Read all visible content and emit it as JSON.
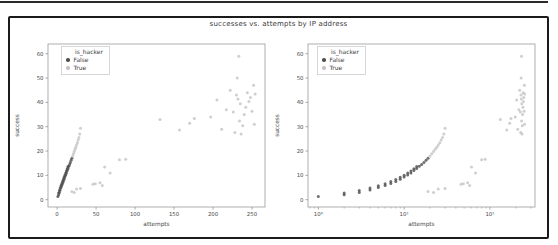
{
  "figure": {
    "title": "successes vs. attempts by IP address"
  },
  "chart_data": {
    "type": "scatter",
    "title": "successes vs. attempts by IP address",
    "xlabel": "attempts",
    "ylabel": "success",
    "legend_title": "is_hacker",
    "legend_position": "upper left inside axes",
    "grid": false,
    "series": [
      {
        "name": "False",
        "color": "#4f4f4f",
        "points": [
          [
            1,
            1.3
          ],
          [
            2,
            2
          ],
          [
            2,
            2.8
          ],
          [
            3,
            3
          ],
          [
            3,
            3.8
          ],
          [
            4,
            4
          ],
          [
            4,
            4.8
          ],
          [
            5,
            5
          ],
          [
            5,
            5.7
          ],
          [
            6,
            5.8
          ],
          [
            6,
            6.6
          ],
          [
            7,
            6.7
          ],
          [
            7,
            7.5
          ],
          [
            8,
            7.5
          ],
          [
            8,
            8.3
          ],
          [
            9,
            8.4
          ],
          [
            9,
            9.2
          ],
          [
            10,
            9.3
          ],
          [
            10,
            10
          ],
          [
            11,
            10.2
          ],
          [
            11,
            11
          ],
          [
            12,
            11
          ],
          [
            12,
            11.8
          ],
          [
            13,
            12
          ],
          [
            13,
            12.7
          ],
          [
            14,
            12.8
          ],
          [
            14,
            13.6
          ],
          [
            15,
            13.7
          ],
          [
            16,
            14.5
          ],
          [
            17,
            15.3
          ],
          [
            18,
            16.2
          ],
          [
            19,
            17
          ]
        ]
      },
      {
        "name": "True",
        "color": "#c4c4c4",
        "points": [
          [
            20,
            18
          ],
          [
            21,
            18.9
          ],
          [
            22,
            19.8
          ],
          [
            23,
            20.7
          ],
          [
            24,
            21.6
          ],
          [
            25,
            22.5
          ],
          [
            26,
            23.4
          ],
          [
            27,
            24.5
          ],
          [
            28,
            25.6
          ],
          [
            29,
            27
          ],
          [
            30,
            29.4
          ],
          [
            19,
            3.4
          ],
          [
            22,
            3
          ],
          [
            25,
            4.4
          ],
          [
            30,
            4.6
          ],
          [
            46,
            6.4
          ],
          [
            49,
            6.6
          ],
          [
            55,
            7
          ],
          [
            58,
            5.8
          ],
          [
            61,
            13.4
          ],
          [
            68,
            11
          ],
          [
            80,
            16.4
          ],
          [
            88,
            16.6
          ],
          [
            132,
            33
          ],
          [
            157,
            28.6
          ],
          [
            170,
            31.4
          ],
          [
            176,
            33.4
          ],
          [
            197,
            34
          ],
          [
            205,
            41
          ],
          [
            211,
            29
          ],
          [
            217,
            37
          ],
          [
            222,
            45
          ],
          [
            226,
            36
          ],
          [
            228,
            27.6
          ],
          [
            230,
            43
          ],
          [
            231,
            50
          ],
          [
            232,
            41.4
          ],
          [
            233,
            59
          ],
          [
            234,
            32.4
          ],
          [
            235,
            39.4
          ],
          [
            236,
            27
          ],
          [
            238,
            30.4
          ],
          [
            240,
            35
          ],
          [
            242,
            38
          ],
          [
            244,
            44
          ],
          [
            246,
            40.4
          ],
          [
            248,
            42
          ],
          [
            250,
            36.4
          ],
          [
            252,
            47
          ],
          [
            253,
            31
          ],
          [
            254,
            43.4
          ]
        ]
      }
    ],
    "plots": [
      {
        "xscale": "linear",
        "xlim": [
          -11.65,
          266.65
        ],
        "ylim": [
          -3,
          64
        ],
        "xticks": [
          {
            "v": 0,
            "label": "0"
          },
          {
            "v": 50,
            "label": "50"
          },
          {
            "v": 100,
            "label": "100"
          },
          {
            "v": 150,
            "label": "150"
          },
          {
            "v": 200,
            "label": "200"
          },
          {
            "v": 250,
            "label": "250"
          }
        ],
        "yticks": [
          {
            "v": 0,
            "label": "0"
          },
          {
            "v": 10,
            "label": "10"
          },
          {
            "v": 20,
            "label": "20"
          },
          {
            "v": 30,
            "label": "30"
          },
          {
            "v": 40,
            "label": "40"
          },
          {
            "v": 50,
            "label": "50"
          },
          {
            "v": 60,
            "label": "60"
          }
        ]
      },
      {
        "xscale": "log",
        "xlim": [
          0.758,
          335
        ],
        "ylim": [
          -3,
          64
        ],
        "xticks": [
          {
            "v": 1,
            "label": "10⁰"
          },
          {
            "v": 10,
            "label": "10¹"
          },
          {
            "v": 100,
            "label": "10²"
          }
        ],
        "yticks": [
          {
            "v": 0,
            "label": "0"
          },
          {
            "v": 10,
            "label": "10"
          },
          {
            "v": 20,
            "label": "20"
          },
          {
            "v": 30,
            "label": "30"
          },
          {
            "v": 40,
            "label": "40"
          },
          {
            "v": 50,
            "label": "50"
          },
          {
            "v": 60,
            "label": "60"
          }
        ]
      }
    ]
  }
}
